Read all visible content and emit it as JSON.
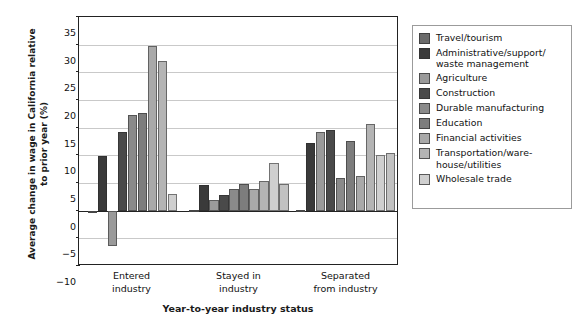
{
  "chart_data": {
    "type": "bar",
    "title": "",
    "xlabel": "Year-to-year industry status",
    "ylabel": "Average change in wage in California relative to prior year (%)",
    "ylim": [
      -10,
      35
    ],
    "ytick_step": 5,
    "yticks": [
      "35",
      "30",
      "25",
      "20",
      "15",
      "10",
      "5",
      "0",
      "-5",
      "-10"
    ],
    "grid": true,
    "legend_position": "right-outside",
    "categories": [
      "Entered industry",
      "Stayed in industry",
      "Separated from industry"
    ],
    "category_labels_multiline": [
      [
        "Entered",
        "industry"
      ],
      [
        "Stayed in",
        "industry"
      ],
      [
        "Separated",
        "from industry"
      ]
    ],
    "series": [
      {
        "name": "Travel/tourism",
        "color": "#6b6b6b",
        "values": [
          -0.5,
          0.2,
          0.2
        ]
      },
      {
        "name": "Administrative/support/ waste management",
        "color": "#3a3a3a",
        "values": [
          9.9,
          4.6,
          12.3
        ]
      },
      {
        "name": "Agriculture",
        "color": "#9a9a9a",
        "values": [
          -6.3,
          2.0,
          14.3
        ]
      },
      {
        "name": "Construction",
        "color": "#4a4a4a",
        "values": [
          14.3,
          2.8,
          14.5
        ]
      },
      {
        "name": "Durable manufacturing",
        "color": "#8a8a8a",
        "values": [
          17.3,
          3.9,
          5.9
        ]
      },
      {
        "name": "Education",
        "color": "#7d7d7d",
        "values": [
          17.7,
          4.9,
          12.6
        ]
      },
      {
        "name": "Financial activities",
        "color": "#a9a9a9",
        "values": [
          29.7,
          4.0,
          6.2
        ]
      },
      {
        "name": "Transportation/ware- house/utilities",
        "color": "#b4b4b4",
        "values": [
          27.0,
          5.3,
          15.7
        ]
      },
      {
        "name": "Wholesale trade",
        "color": "#cfcfcf",
        "values": [
          3.0,
          8.7,
          10.1
        ]
      }
    ],
    "extra_bar_note": "",
    "series_extra": {
      "name": "Wholesale trade second",
      "values": [
        null,
        4.9,
        10.4
      ]
    }
  },
  "legend": {
    "items": [
      {
        "label": "Travel/tourism",
        "color": "#6b6b6b"
      },
      {
        "label": "Administrative/support/",
        "label2": "waste management",
        "color": "#3a3a3a"
      },
      {
        "label": "Agriculture",
        "color": "#9a9a9a"
      },
      {
        "label": "Construction",
        "color": "#4a4a4a"
      },
      {
        "label": "Durable manufacturing",
        "color": "#8a8a8a"
      },
      {
        "label": "Education",
        "color": "#7d7d7d"
      },
      {
        "label": "Financial activities",
        "color": "#a9a9a9"
      },
      {
        "label": "Transportation/ware-",
        "label2": "house/utilities",
        "color": "#b4b4b4"
      },
      {
        "label": "Wholesale trade",
        "color": "#cfcfcf"
      }
    ]
  },
  "axes": {
    "y_title": "Average change in wage in California relative to prior year (%)",
    "y_title_line1": "Average change in wage in California relative",
    "y_title_line2": "to prior year (%)",
    "x_title": "Year-to-year industry status"
  }
}
